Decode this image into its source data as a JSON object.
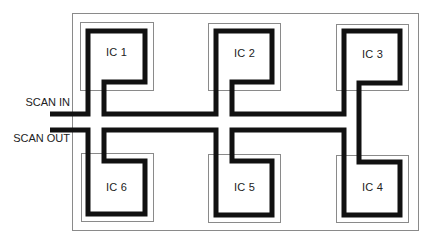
{
  "diagram": {
    "colors": {
      "trace": "#111111",
      "outline": "#8a8a8a",
      "background": "#ffffff",
      "text": "#222222"
    },
    "ports": {
      "scan_in": "SCAN IN",
      "scan_out": "SCAN OUT"
    },
    "chips": [
      {
        "id": "ic1",
        "label": "IC 1"
      },
      {
        "id": "ic2",
        "label": "IC 2"
      },
      {
        "id": "ic3",
        "label": "IC 3"
      },
      {
        "id": "ic4",
        "label": "IC 4"
      },
      {
        "id": "ic5",
        "label": "IC 5"
      },
      {
        "id": "ic6",
        "label": "IC 6"
      }
    ],
    "chain_order": [
      "SCAN IN",
      "IC 1",
      "IC 2",
      "IC 3",
      "IC 4",
      "IC 5",
      "IC 6",
      "SCAN OUT"
    ]
  }
}
